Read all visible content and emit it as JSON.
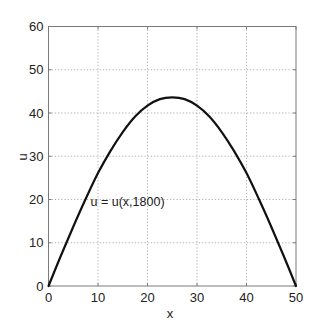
{
  "chart_data": {
    "type": "line",
    "title": "",
    "xlabel": "x",
    "ylabel": "u",
    "xlim": [
      0,
      50
    ],
    "ylim": [
      0,
      60
    ],
    "xticks": [
      0,
      10,
      20,
      30,
      40,
      50
    ],
    "yticks": [
      0,
      10,
      20,
      30,
      40,
      50,
      60
    ],
    "xtick_labels": [
      "0",
      "10",
      "20",
      "30",
      "40",
      "50"
    ],
    "ytick_labels": [
      "0",
      "10",
      "20",
      "30",
      "40",
      "50",
      "60"
    ],
    "grid": true,
    "legend": null,
    "annotations": [
      {
        "text": "u = u(x,1800)",
        "x": 8.5,
        "y": 18.5
      }
    ],
    "series": [
      {
        "name": "u = u(x,1800)",
        "color": "#111111",
        "x": [
          0,
          2.5,
          5,
          7.5,
          10,
          12.5,
          15,
          17.5,
          20,
          22.5,
          25,
          27.5,
          30,
          32.5,
          35,
          37.5,
          40,
          42.5,
          45,
          47.5,
          50
        ],
        "y": [
          0,
          7.0,
          13.7,
          20.1,
          26.1,
          31.2,
          35.6,
          39.2,
          41.7,
          43.2,
          43.6,
          43.2,
          41.7,
          39.2,
          35.6,
          31.2,
          26.1,
          20.1,
          13.7,
          7.0,
          0
        ]
      }
    ]
  },
  "colors": {
    "axis": "#7a7a7a",
    "grid": "#9a9a9a",
    "line": "#111111",
    "text": "#222222"
  }
}
